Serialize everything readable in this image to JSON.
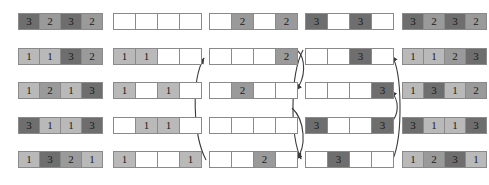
{
  "figure": {
    "type": "bucket-distribution-diagram",
    "rows": 5,
    "cells_per_row": 4,
    "cell_width_px": 22,
    "cell_height_px": 17,
    "row_y": [
      13,
      48,
      82,
      117,
      151
    ],
    "colors": {
      "value_1": "#b9b9b9",
      "value_2": "#9a9a9a",
      "value_3": "#6e6e6e",
      "empty": "#ffffff",
      "border": "#8a8a8a",
      "arrow": "#3a3a3a",
      "text": "#1b1b1b",
      "background": "#ffffff"
    }
  },
  "columns": [
    {
      "name": "input-column",
      "x": 18,
      "rows": [
        {
          "cells": [
            "3",
            "2",
            "3",
            "2"
          ]
        },
        {
          "cells": [
            "1",
            "1",
            "3",
            "2"
          ]
        },
        {
          "cells": [
            "1",
            "2",
            "1",
            "3"
          ]
        },
        {
          "cells": [
            "3",
            "1",
            "1",
            "3"
          ]
        },
        {
          "cells": [
            "1",
            "3",
            "2",
            "1"
          ]
        }
      ]
    },
    {
      "name": "ones-column",
      "x": 113,
      "rows": [
        {
          "cells": [
            "",
            "",
            "",
            ""
          ]
        },
        {
          "cells": [
            "1",
            "1",
            "",
            ""
          ]
        },
        {
          "cells": [
            "1",
            "",
            "1",
            ""
          ]
        },
        {
          "cells": [
            "",
            "1",
            "1",
            ""
          ]
        },
        {
          "cells": [
            "1",
            "",
            "",
            "1"
          ]
        }
      ]
    },
    {
      "name": "twos-column",
      "x": 209,
      "rows": [
        {
          "cells": [
            "",
            "2",
            "",
            "2"
          ]
        },
        {
          "cells": [
            "",
            "",
            "",
            "2"
          ]
        },
        {
          "cells": [
            "",
            "2",
            "",
            ""
          ]
        },
        {
          "cells": [
            "",
            "",
            "",
            ""
          ]
        },
        {
          "cells": [
            "",
            "",
            "2",
            ""
          ]
        }
      ]
    },
    {
      "name": "threes-column",
      "x": 305,
      "rows": [
        {
          "cells": [
            "3",
            "",
            "3",
            ""
          ]
        },
        {
          "cells": [
            "",
            "",
            "3",
            ""
          ]
        },
        {
          "cells": [
            "",
            "",
            "",
            "3"
          ]
        },
        {
          "cells": [
            "3",
            "",
            "",
            "3"
          ]
        },
        {
          "cells": [
            "",
            "3",
            "",
            ""
          ]
        }
      ]
    },
    {
      "name": "output-column",
      "x": 402,
      "rows": [
        {
          "cells": [
            "3",
            "2",
            "3",
            "2"
          ]
        },
        {
          "cells": [
            "1",
            "1",
            "2",
            "3"
          ]
        },
        {
          "cells": [
            "1",
            "3",
            "1",
            "2"
          ]
        },
        {
          "cells": [
            "3",
            "1",
            "1",
            "3"
          ]
        },
        {
          "cells": [
            "1",
            "2",
            "3",
            "1"
          ]
        }
      ]
    }
  ],
  "arrows": [
    {
      "name": "twos-left-row5-to-row2",
      "from_row": 5,
      "to_row": 2,
      "side": "left",
      "group": "twos"
    },
    {
      "name": "twos-right-row2-to-row3",
      "from_row": 2,
      "to_row": 3,
      "side": "right",
      "group": "twos"
    },
    {
      "name": "twos-right-row3-to-row5",
      "from_row": 3,
      "to_row": 5,
      "side": "right",
      "group": "twos"
    },
    {
      "name": "threes-left-row2-to-row5",
      "from_row": 2,
      "to_row": 5,
      "side": "left",
      "group": "threes"
    },
    {
      "name": "threes-right-row5-to-row2",
      "from_row": 5,
      "to_row": 2,
      "side": "right",
      "group": "threes"
    },
    {
      "name": "threes-right-row4-to-row3",
      "from_row": 4,
      "to_row": 3,
      "side": "right",
      "group": "threes"
    }
  ]
}
